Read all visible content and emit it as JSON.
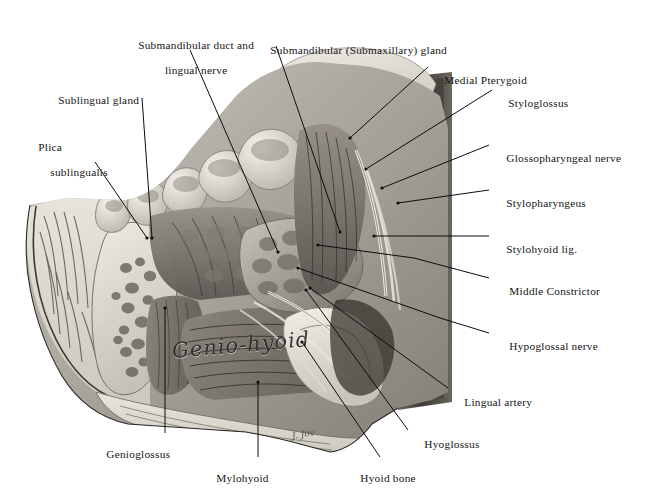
{
  "plate": {
    "title": "Dissection of the floor of the mouth and submandibular region",
    "style": "grayscale anatomical halftone illustration",
    "handwritten_muscle_label": "Genio-hyoid",
    "artist_signature": "J. Jov",
    "background_color": "#ffffff",
    "ink_color": "#0d0d0d"
  },
  "labels": [
    {
      "id": "submandibular-duct-and-lingual-nerve",
      "text_line1": "Submandibular duct and",
      "text_line2": "lingual nerve",
      "side": "top"
    },
    {
      "id": "submandibular-submaxillary-gland",
      "text_line1": "Submandibular (Submaxillary) gland",
      "text_line2": "",
      "side": "top"
    },
    {
      "id": "sublingual-gland",
      "text_line1": "Sublingual gland",
      "text_line2": "",
      "side": "left"
    },
    {
      "id": "plica-sublingualis",
      "text_line1": "Plica",
      "text_line2": "sublingualis",
      "side": "left"
    },
    {
      "id": "medial-pterygoid",
      "text_line1": "Medial Pterygoid",
      "text_line2": "",
      "side": "right"
    },
    {
      "id": "styloglossus",
      "text_line1": "Styloglossus",
      "text_line2": "",
      "side": "right"
    },
    {
      "id": "glossopharyngeal-nerve",
      "text_line1": "Glossopharyngeal nerve",
      "text_line2": "",
      "side": "right"
    },
    {
      "id": "stylopharyngeus",
      "text_line1": "Stylopharyngeus",
      "text_line2": "",
      "side": "right"
    },
    {
      "id": "stylohyoid-lig",
      "text_line1": "Stylohyoid lig.",
      "text_line2": "",
      "side": "right"
    },
    {
      "id": "middle-constrictor",
      "text_line1": "Middle Constrictor",
      "text_line2": "",
      "side": "right"
    },
    {
      "id": "hypoglossal-nerve",
      "text_line1": "Hypoglossal nerve",
      "text_line2": "",
      "side": "right"
    },
    {
      "id": "lingual-artery",
      "text_line1": "Lingual artery",
      "text_line2": "",
      "side": "right"
    },
    {
      "id": "hyoglossus",
      "text_line1": "Hyoglossus",
      "text_line2": "",
      "side": "bottom-right"
    },
    {
      "id": "hyoid-bone",
      "text_line1": "Hyoid bone",
      "text_line2": "",
      "side": "bottom"
    },
    {
      "id": "mylohyoid",
      "text_line1": "Mylohyoid",
      "text_line2": "",
      "side": "bottom"
    },
    {
      "id": "genioglossus",
      "text_line1": "Genioglossus",
      "text_line2": "",
      "side": "bottom-left"
    }
  ]
}
